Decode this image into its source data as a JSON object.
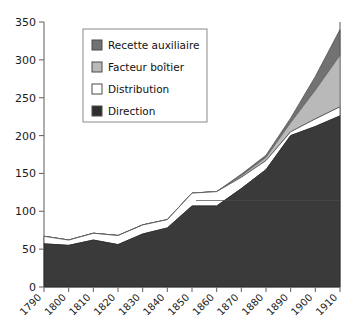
{
  "chart_data": {
    "type": "area",
    "title": "",
    "subtitle": "",
    "xlabel": "",
    "ylabel": "",
    "stacked": true,
    "grid": false,
    "legend_position": "top-left-inside",
    "xlim": [
      1790,
      1910
    ],
    "ylim": [
      0,
      350
    ],
    "ytick_step": 50,
    "x": [
      1790,
      1800,
      1810,
      1820,
      1830,
      1840,
      1850,
      1860,
      1870,
      1880,
      1890,
      1900,
      1910
    ],
    "categories": [
      "1790",
      "1800",
      "1810",
      "1820",
      "1830",
      "1840",
      "1850",
      "1860",
      "1870",
      "1880",
      "1890",
      "1900",
      "1910"
    ],
    "ytick_labels": [
      "0",
      "50",
      "100",
      "150",
      "200",
      "250",
      "300",
      "350"
    ],
    "ytick_values": [
      0,
      50,
      100,
      150,
      200,
      250,
      300,
      350
    ],
    "series": [
      {
        "name": "Direction",
        "color": "#3a3a3a",
        "values": [
          57,
          55,
          62,
          56,
          70,
          78,
          107,
          107,
          130,
          155,
          200,
          212,
          226
        ]
      },
      {
        "name": "Distribution",
        "color": "#ffffff",
        "values": [
          10,
          7,
          9,
          12,
          12,
          11,
          17,
          19,
          15,
          12,
          5,
          10,
          12
        ]
      },
      {
        "name": "Facteur boîtier",
        "color": "#b9b9b9",
        "values": [
          0,
          0,
          0,
          0,
          0,
          0,
          0,
          0,
          2,
          4,
          12,
          38,
          68
        ]
      },
      {
        "name": "Recette auxiliaire",
        "color": "#727272",
        "values": [
          0,
          0,
          0,
          0,
          0,
          0,
          0,
          0,
          2,
          3,
          6,
          18,
          34
        ]
      }
    ],
    "cumulative_totals": [
      67,
      62,
      71,
      68,
      82,
      89,
      124,
      126,
      149,
      174,
      223,
      278,
      340
    ],
    "annotations": []
  },
  "legend": {
    "entries": [
      {
        "label": "Recette auxiliaire",
        "color": "#727272",
        "swatch": "legend-swatch-recette"
      },
      {
        "label": "Facteur boîtier",
        "color": "#b9b9b9",
        "swatch": "legend-swatch-facteur"
      },
      {
        "label": "Distribution",
        "color": "#ffffff",
        "swatch": "legend-swatch-distribution"
      },
      {
        "label": "Direction",
        "color": "#2e2e2e",
        "swatch": "legend-swatch-direction"
      }
    ]
  },
  "axes": {
    "y_labels": [
      "350",
      "300",
      "250",
      "200",
      "150",
      "100",
      "50",
      "0"
    ],
    "x_labels": [
      "1790",
      "1800",
      "1810",
      "1820",
      "1830",
      "1840",
      "1850",
      "1860",
      "1870",
      "1880",
      "1890",
      "1900",
      "1910"
    ]
  },
  "colors": {
    "direction": "#3a3a3a",
    "distribution": "#ffffff",
    "facteur": "#b9b9b9",
    "recette": "#727272",
    "axis": "#6b6b6b",
    "text": "#1a1a1a",
    "background": "#ffffff"
  }
}
